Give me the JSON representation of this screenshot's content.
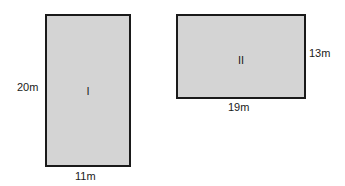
{
  "figures": [
    {
      "id": "I",
      "label": "I",
      "height_label": "20m",
      "width_label": "11m",
      "fill": "#d4d4d4"
    },
    {
      "id": "II",
      "label": "II",
      "height_label": "13m",
      "width_label": "19m",
      "fill": "#d4d4d4"
    }
  ]
}
